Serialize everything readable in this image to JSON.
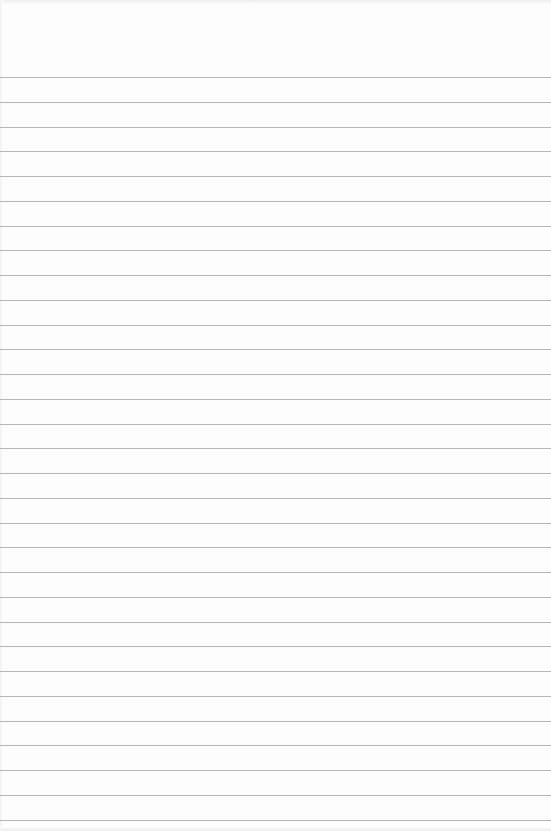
{
  "page": {
    "type": "lined-paper",
    "background_color": "#fdfdfd",
    "rule_color": "#a9a9a9",
    "rule_count": 31,
    "first_rule_y": 77,
    "rule_spacing": 24.75,
    "text_content": []
  }
}
